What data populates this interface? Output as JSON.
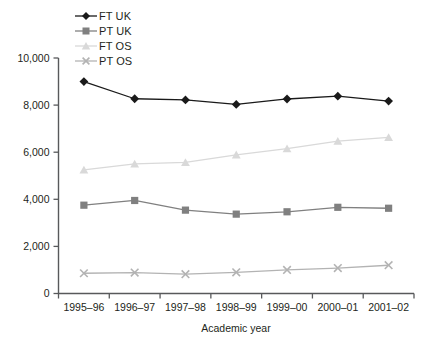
{
  "chart_data": {
    "type": "line",
    "title": "",
    "subtitle": "",
    "xlabel": "Academic year",
    "ylabel": "",
    "categories": [
      "1995–96",
      "1996–97",
      "1997–98",
      "1998–99",
      "1999–00",
      "2000–01",
      "2001–02"
    ],
    "ylim": [
      0,
      10000
    ],
    "ytick_step": 2000,
    "yticks": [
      0,
      2000,
      4000,
      6000,
      8000,
      10000
    ],
    "ytick_labels": [
      "0",
      "2,000",
      "4,000",
      "6,000",
      "8,000",
      "10,000"
    ],
    "grid": false,
    "legend_position": "top-left",
    "series": [
      {
        "name": "FT UK",
        "color": "#1a1a1a",
        "marker": "diamond",
        "values": [
          9000,
          8270,
          8220,
          8030,
          8260,
          8380,
          8170
        ]
      },
      {
        "name": "PT UK",
        "color": "#808080",
        "marker": "square",
        "values": [
          3750,
          3950,
          3540,
          3370,
          3470,
          3660,
          3620
        ]
      },
      {
        "name": "FT OS",
        "color": "#d9d9d9",
        "marker": "triangle",
        "values": [
          5250,
          5500,
          5570,
          5890,
          6150,
          6470,
          6630
        ]
      },
      {
        "name": "PT OS",
        "color": "#b3b3b3",
        "marker": "cross",
        "values": [
          860,
          890,
          820,
          900,
          1000,
          1080,
          1200
        ]
      }
    ]
  },
  "legend": {
    "items": [
      {
        "label": "FT UK"
      },
      {
        "label": "PT UK"
      },
      {
        "label": "FT OS"
      },
      {
        "label": "PT OS"
      }
    ]
  },
  "axes": {
    "x_title": "Academic year",
    "y_tick_labels": [
      "10,000",
      "8,000",
      "6,000",
      "4,000",
      "2,000",
      "0"
    ],
    "x_tick_labels": [
      "1995–96",
      "1996–97",
      "1997–98",
      "1998–99",
      "1999–00",
      "2000–01",
      "2001–02"
    ]
  },
  "colors": {
    "axis": "#58595b",
    "text": "#231f20",
    "ft_uk": "#1a1a1a",
    "pt_uk": "#808080",
    "ft_os": "#d9d9d9",
    "pt_os": "#b3b3b3",
    "background": "#ffffff"
  }
}
